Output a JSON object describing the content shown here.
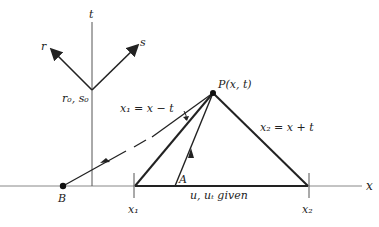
{
  "diagram": {
    "axes": {
      "x_label": "x",
      "t_label": "t"
    },
    "characteristic_directions": {
      "r_label": "r",
      "s_label": "s",
      "origin_label": "r₀, s₀"
    },
    "point_P": "P(x, t)",
    "point_A": "A",
    "point_B": "B",
    "left_characteristic": "x₁ = x − t",
    "right_characteristic": "x₂ = x + t",
    "interval_label": "u, uₜ given",
    "x1_tick": "x₁",
    "x2_tick": "x₂"
  }
}
